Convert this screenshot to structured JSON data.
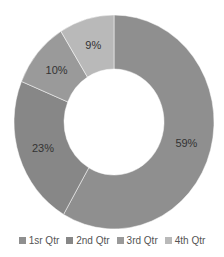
{
  "chart_data": {
    "type": "pie",
    "variant": "doughnut",
    "title": "",
    "categories": [
      "1sr Qtr",
      "2nd Qtr",
      "3rd Qtr",
      "4th Qtr"
    ],
    "values": [
      59,
      23,
      10,
      9
    ],
    "labels": [
      "59%",
      "23%",
      "10%",
      "9%"
    ],
    "colors": [
      "#8f8f8f",
      "#878787",
      "#9a9a9a",
      "#b9b9b9"
    ],
    "legend_position": "bottom",
    "start_angle_deg": 0,
    "direction": "clockwise",
    "geometry": {
      "cx": 114,
      "cy": 122,
      "rx": 100,
      "ry": 107,
      "inner_rx": 50,
      "inner_ry": 53
    }
  },
  "legend": {
    "items": [
      {
        "label": "1sr Qtr",
        "color": "#8f8f8f"
      },
      {
        "label": "2nd Qtr",
        "color": "#878787"
      },
      {
        "label": "3rd Qtr",
        "color": "#9a9a9a"
      },
      {
        "label": "4th Qtr",
        "color": "#b9b9b9"
      }
    ]
  }
}
